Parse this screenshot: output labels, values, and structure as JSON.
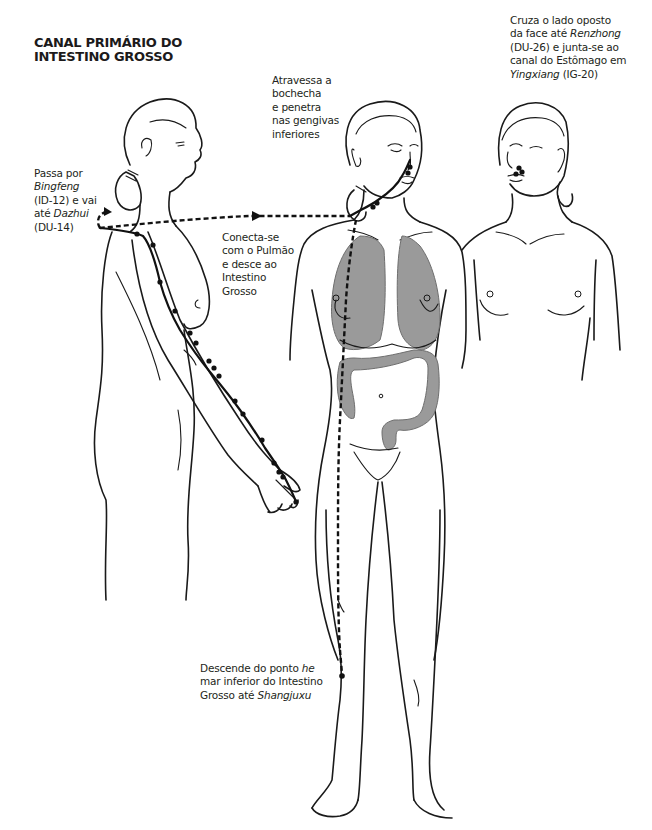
{
  "title": {
    "line1": "CANAL PRIMÁRIO DO",
    "line2": "INTESTINO GROSSO"
  },
  "annotations": {
    "bingfeng": {
      "l1": "Passa por",
      "l2_italic": "Bingfeng",
      "l3": "(ID-12) e vai",
      "l4_prefix": "até ",
      "l4_italic": "Dazhui",
      "l5": "(DU-14)"
    },
    "bochecha": {
      "l1": "Atravessa a",
      "l2": "bochecha",
      "l3": "e penetra",
      "l4": "nas gengivas",
      "l5": "inferiores"
    },
    "renzhong": {
      "l1": "Cruza o lado oposto",
      "l2_prefix": "da face até ",
      "l2_italic": "Renzhong",
      "l3": "(DU-26) e junta-se ao",
      "l4": "canal do Estômago em",
      "l5_italic": "Yingxiang",
      "l5_suffix": " (IG-20)"
    },
    "pulmao": {
      "l1": "Conecta-se",
      "l2": "com o Pulmão",
      "l3": "e desce ao",
      "l4": "Intestino",
      "l5": "Grosso"
    },
    "shangjuxu": {
      "l1_prefix": "Descende do ponto ",
      "l1_italic": "he",
      "l2": "mar inferior do Intestino",
      "l3_prefix": "Grosso até ",
      "l3_italic": "Shangjuxu"
    }
  },
  "figures": [
    {
      "name": "side-view",
      "description": "Lateral figure with arm channel points from index finger to shoulder"
    },
    {
      "name": "front-view",
      "description": "Frontal full-body figure with lungs, large intestine, and leg branch"
    },
    {
      "name": "face-view",
      "description": "Three-quarter upper body showing crossing at upper lip to nose"
    }
  ],
  "colors": {
    "line": "#1a1a1a",
    "organ_fill": "#9a9a9a",
    "channel": "#111111",
    "background": "#ffffff"
  }
}
